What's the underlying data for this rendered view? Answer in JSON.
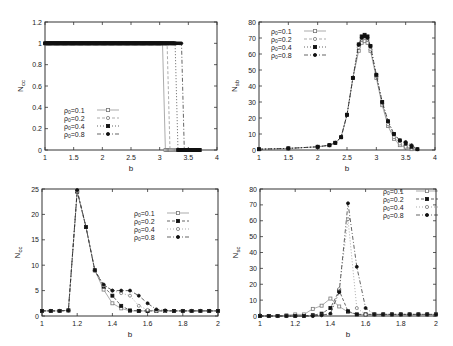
{
  "chart_data": [
    {
      "id": "top-left",
      "type": "line",
      "title": "",
      "xlabel": "b",
      "ylabel": "N_cc",
      "xlim": [
        1,
        4
      ],
      "ylim": [
        0,
        1.2
      ],
      "xticks": [
        1,
        1.5,
        2,
        2.5,
        3,
        3.5,
        4
      ],
      "yticks": [
        0,
        0.2,
        0.4,
        0.6,
        0.8,
        1,
        1.2
      ],
      "grid": false,
      "legend_position": "lower-left",
      "series": [
        {
          "name": "ρ0=0.1",
          "marker": "open-square",
          "dash": "",
          "x": [
            1,
            3.05,
            3.1,
            3.7
          ],
          "y": [
            1,
            1,
            0,
            0
          ]
        },
        {
          "name": "ρ0=0.2",
          "marker": "open-circle",
          "dash": "3,2",
          "x": [
            1,
            3.13,
            3.18,
            3.7
          ],
          "y": [
            1,
            1,
            0,
            0
          ]
        },
        {
          "name": "ρ0=0.4",
          "marker": "filled-square",
          "dash": "1,2",
          "x": [
            1,
            3.27,
            3.32,
            3.7
          ],
          "y": [
            1,
            1,
            0,
            0
          ]
        },
        {
          "name": "ρ0=0.8",
          "marker": "filled-circle",
          "dash": "4,2,1,2",
          "x": [
            1,
            3.38,
            3.43,
            3.7
          ],
          "y": [
            1,
            1,
            0,
            0
          ]
        }
      ]
    },
    {
      "id": "top-right",
      "type": "line",
      "title": "",
      "xlabel": "b",
      "ylabel": "N_sb",
      "xlim": [
        1,
        4
      ],
      "ylim": [
        0,
        80
      ],
      "xticks": [
        1,
        1.5,
        2,
        2.5,
        3,
        3.5,
        4
      ],
      "yticks": [
        0,
        10,
        20,
        30,
        40,
        50,
        60,
        70,
        80
      ],
      "grid": false,
      "legend_position": "upper-left",
      "series": [
        {
          "name": "ρ0=0.1",
          "marker": "open-square",
          "dash": "",
          "x": [
            1,
            1.5,
            2,
            2.2,
            2.3,
            2.4,
            2.5,
            2.6,
            2.7,
            2.75,
            2.8,
            2.85,
            2.9,
            3.0,
            3.1,
            3.2,
            3.3,
            3.4,
            3.5,
            3.6
          ],
          "y": [
            0.5,
            1,
            2,
            3,
            4.5,
            8,
            22,
            45,
            62,
            67,
            68,
            67,
            62,
            45,
            28,
            15,
            7,
            3,
            1.5,
            0.5
          ]
        },
        {
          "name": "ρ0=0.2",
          "marker": "open-circle",
          "dash": "3,2",
          "x": [
            1,
            1.5,
            2,
            2.2,
            2.3,
            2.4,
            2.5,
            2.6,
            2.7,
            2.75,
            2.8,
            2.85,
            2.9,
            3.0,
            3.1,
            3.2,
            3.3,
            3.4,
            3.5,
            3.6
          ],
          "y": [
            0.5,
            1,
            2,
            3,
            4.5,
            8,
            22,
            45,
            64,
            69,
            70,
            69,
            63,
            46,
            29,
            16,
            8,
            4,
            2,
            0.8
          ]
        },
        {
          "name": "ρ0=0.4",
          "marker": "filled-square",
          "dash": "1,2",
          "x": [
            1,
            1.5,
            2,
            2.2,
            2.3,
            2.4,
            2.5,
            2.6,
            2.7,
            2.75,
            2.8,
            2.85,
            2.9,
            3.0,
            3.1,
            3.2,
            3.3,
            3.4,
            3.5,
            3.6,
            3.7
          ],
          "y": [
            0.5,
            1,
            2,
            3,
            4.5,
            8,
            22,
            45,
            66,
            71,
            72,
            71,
            65,
            47,
            30,
            18,
            10,
            6,
            4,
            2,
            0.5
          ]
        },
        {
          "name": "ρ0=0.8",
          "marker": "filled-circle",
          "dash": "4,2,1,2",
          "x": [
            1,
            1.5,
            2,
            2.2,
            2.3,
            2.4,
            2.5,
            2.6,
            2.7,
            2.75,
            2.8,
            2.85,
            2.9,
            3.0,
            3.1,
            3.2,
            3.3,
            3.4,
            3.5,
            3.6,
            3.7
          ],
          "y": [
            0.5,
            1,
            2,
            3,
            4.5,
            8,
            22,
            45,
            66,
            70,
            71,
            70,
            65,
            47,
            30,
            18,
            10,
            6,
            5,
            3,
            0.5
          ]
        }
      ]
    },
    {
      "id": "bottom-left",
      "type": "line",
      "title": "",
      "xlabel": "b",
      "ylabel": "N_cc",
      "xlim": [
        1,
        2
      ],
      "ylim": [
        0,
        25
      ],
      "xticks": [
        1,
        1.2,
        1.4,
        1.6,
        1.8,
        2
      ],
      "yticks": [
        0,
        5,
        10,
        15,
        20,
        25
      ],
      "grid": false,
      "legend_position": "upper-right",
      "series": [
        {
          "name": "ρ0=0.1",
          "marker": "open-square",
          "dash": "",
          "x": [
            1,
            1.05,
            1.1,
            1.15,
            1.2,
            1.25,
            1.3,
            1.35,
            1.4,
            1.45,
            1.5,
            1.55,
            1.6,
            1.65,
            1.7,
            1.75,
            1.8,
            1.85,
            1.9,
            1.95,
            2
          ],
          "y": [
            1,
            1,
            1,
            1.1,
            24.5,
            17.5,
            9,
            5.2,
            2.5,
            1.5,
            1,
            1,
            1,
            1,
            1,
            1,
            1,
            1,
            1,
            1,
            1
          ]
        },
        {
          "name": "ρ0=0.2",
          "marker": "filled-square",
          "dash": "3,2",
          "x": [
            1,
            1.05,
            1.1,
            1.15,
            1.2,
            1.25,
            1.3,
            1.35,
            1.4,
            1.45,
            1.5,
            1.55,
            1.6,
            1.65,
            1.7,
            1.75,
            1.8,
            1.85,
            1.9,
            1.95,
            2
          ],
          "y": [
            1,
            1,
            1,
            1.1,
            24.5,
            17.5,
            9,
            5.8,
            4,
            2,
            1.1,
            1,
            1,
            1,
            1,
            1,
            1,
            1,
            1,
            1,
            1
          ]
        },
        {
          "name": "ρ0=0.4",
          "marker": "open-circle",
          "dash": "1,2",
          "x": [
            1,
            1.05,
            1.1,
            1.15,
            1.2,
            1.25,
            1.3,
            1.35,
            1.4,
            1.45,
            1.5,
            1.55,
            1.6,
            1.65,
            1.7,
            1.75,
            1.8,
            1.85,
            1.9,
            1.95,
            2
          ],
          "y": [
            1,
            1,
            1,
            1.1,
            24.5,
            17.5,
            9,
            6,
            5,
            4.5,
            4,
            2,
            1.2,
            1,
            1,
            1,
            1,
            1,
            1,
            1,
            1
          ]
        },
        {
          "name": "ρ0=0.8",
          "marker": "filled-circle",
          "dash": "4,2,1,2",
          "x": [
            1,
            1.05,
            1.1,
            1.15,
            1.2,
            1.25,
            1.3,
            1.35,
            1.4,
            1.45,
            1.5,
            1.55,
            1.6,
            1.65,
            1.7,
            1.75,
            1.8,
            1.85,
            1.9,
            1.95,
            2
          ],
          "y": [
            1,
            1,
            1,
            1.1,
            24.8,
            17.5,
            9,
            6.2,
            5,
            5,
            5,
            4,
            2.5,
            1.3,
            1.1,
            1,
            1,
            1,
            1,
            1,
            1
          ]
        }
      ]
    },
    {
      "id": "bottom-right",
      "type": "line",
      "title": "",
      "xlabel": "b",
      "ylabel": "N_sc",
      "xlim": [
        1,
        2
      ],
      "ylim": [
        0,
        80
      ],
      "xticks": [
        1,
        1.2,
        1.4,
        1.6,
        1.8,
        2
      ],
      "yticks": [
        0,
        10,
        20,
        30,
        40,
        50,
        60,
        70,
        80
      ],
      "grid": false,
      "legend_position": "upper-right",
      "series": [
        {
          "name": "ρ0=0.1",
          "marker": "open-square",
          "dash": "",
          "x": [
            1,
            1.05,
            1.1,
            1.15,
            1.2,
            1.25,
            1.3,
            1.35,
            1.4,
            1.45,
            1.5,
            1.55,
            1.6,
            1.65,
            1.7,
            1.75,
            1.8,
            1.85,
            1.9,
            1.95,
            2
          ],
          "y": [
            0,
            0,
            0,
            0.5,
            1,
            1,
            4.5,
            6.5,
            11,
            6,
            2.5,
            1,
            1,
            1,
            1,
            1,
            1,
            1,
            1,
            1,
            1
          ]
        },
        {
          "name": "ρ0=0.2",
          "marker": "filled-square",
          "dash": "3,2",
          "x": [
            1,
            1.05,
            1.1,
            1.15,
            1.2,
            1.25,
            1.3,
            1.35,
            1.4,
            1.45,
            1.5,
            1.55,
            1.6,
            1.65,
            1.7,
            1.75,
            1.8,
            1.85,
            1.9,
            1.95,
            2
          ],
          "y": [
            0,
            0,
            0,
            0,
            0,
            0,
            0.5,
            1.5,
            5,
            16,
            3,
            1,
            1,
            1,
            1,
            1,
            1,
            1,
            1,
            1,
            1
          ]
        },
        {
          "name": "ρ0=0.4",
          "marker": "open-circle",
          "dash": "1,2",
          "x": [
            1,
            1.05,
            1.1,
            1.15,
            1.2,
            1.25,
            1.3,
            1.35,
            1.4,
            1.45,
            1.5,
            1.55,
            1.6,
            1.65,
            1.7,
            1.75,
            1.8,
            1.85,
            1.9,
            1.95,
            2
          ],
          "y": [
            0,
            0,
            0,
            0,
            0,
            0,
            0,
            0.5,
            1,
            17,
            61,
            5,
            1,
            1,
            1,
            1,
            1,
            1,
            1,
            1,
            1
          ]
        },
        {
          "name": "ρ0=0.8",
          "marker": "filled-circle",
          "dash": "4,2,1,2",
          "x": [
            1,
            1.05,
            1.1,
            1.15,
            1.2,
            1.25,
            1.3,
            1.35,
            1.4,
            1.45,
            1.5,
            1.55,
            1.6,
            1.65,
            1.7,
            1.75,
            1.8,
            1.85,
            1.9,
            1.95,
            2
          ],
          "y": [
            0,
            0,
            0,
            0,
            0,
            0,
            0,
            0.5,
            1.5,
            15,
            71,
            31,
            5,
            1,
            1,
            1,
            1,
            1,
            1,
            1,
            1
          ]
        }
      ]
    }
  ],
  "panels": [
    {
      "ylabel_main": "N",
      "ylabel_sub": "cc",
      "xlabel": "b"
    },
    {
      "ylabel_main": "N",
      "ylabel_sub": "sb",
      "xlabel": "b"
    },
    {
      "ylabel_main": "N",
      "ylabel_sub": "cc",
      "xlabel": "b"
    },
    {
      "ylabel_main": "N",
      "ylabel_sub": "sc",
      "xlabel": "b"
    }
  ],
  "legend_labels": [
    "ρ0=0.1",
    "ρ0=0.2",
    "ρ0=0.4",
    "ρ0=0.8"
  ],
  "colors": {
    "axis": "#333333",
    "line_light": "#888888",
    "line_dark": "#222222",
    "marker_open": "#777777",
    "marker_filled": "#111111"
  }
}
